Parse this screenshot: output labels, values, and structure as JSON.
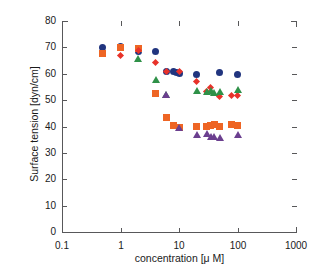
{
  "chart_data": {
    "type": "scatter",
    "title": "",
    "xlabel": "concentration [μ M]",
    "ylabel": "Surface tension [dyn/cm]",
    "xscale": "log",
    "xlim": [
      0.1,
      1000
    ],
    "ylim": [
      0,
      80
    ],
    "xticks": [
      0.1,
      1,
      10,
      100,
      1000
    ],
    "xticklabels": [
      "0.1",
      "1",
      "10",
      "100",
      "1000"
    ],
    "yticks": [
      0,
      10,
      20,
      30,
      40,
      50,
      60,
      70,
      80
    ],
    "yticklabels": [
      "0",
      "10",
      "20",
      "30",
      "40",
      "50",
      "60",
      "70",
      "80"
    ],
    "grid": false,
    "legend": "none",
    "series": [
      {
        "name": "blue-circles",
        "marker": "circle",
        "color": "#21357f",
        "points": [
          {
            "x": 0.5,
            "y": 70.0
          },
          {
            "x": 1.0,
            "y": 70.3
          },
          {
            "x": 2.0,
            "y": 68.5
          },
          {
            "x": 4.0,
            "y": 68.4
          },
          {
            "x": 6.0,
            "y": 60.8
          },
          {
            "x": 8.0,
            "y": 60.8
          },
          {
            "x": 9.0,
            "y": 60.6
          },
          {
            "x": 10.0,
            "y": 60.2
          },
          {
            "x": 20.0,
            "y": 59.9
          },
          {
            "x": 50.0,
            "y": 60.5
          },
          {
            "x": 100.0,
            "y": 59.9
          }
        ]
      },
      {
        "name": "orange-squares",
        "marker": "square",
        "color": "#ee6524",
        "points": [
          {
            "x": 0.5,
            "y": 67.7
          },
          {
            "x": 1.0,
            "y": 69.8
          },
          {
            "x": 2.0,
            "y": 69.6
          },
          {
            "x": 4.0,
            "y": 52.6
          },
          {
            "x": 6.0,
            "y": 43.4
          },
          {
            "x": 8.0,
            "y": 40.3
          },
          {
            "x": 10.0,
            "y": 39.8
          },
          {
            "x": 20.0,
            "y": 40.1
          },
          {
            "x": 30.0,
            "y": 40.1
          },
          {
            "x": 35.0,
            "y": 40.4
          },
          {
            "x": 40.0,
            "y": 40.6
          },
          {
            "x": 50.0,
            "y": 40.0
          },
          {
            "x": 80.0,
            "y": 40.6
          },
          {
            "x": 100.0,
            "y": 40.2
          }
        ]
      },
      {
        "name": "red-diamonds",
        "marker": "diamond",
        "color": "#e8322a",
        "points": [
          {
            "x": 1.0,
            "y": 67.0
          },
          {
            "x": 2.0,
            "y": 69.0
          },
          {
            "x": 4.0,
            "y": 64.3
          },
          {
            "x": 6.0,
            "y": 61.0
          },
          {
            "x": 10.0,
            "y": 60.7
          },
          {
            "x": 20.0,
            "y": 57.2
          },
          {
            "x": 30.0,
            "y": 53.2
          },
          {
            "x": 35.0,
            "y": 54.8
          },
          {
            "x": 50.0,
            "y": 51.5
          },
          {
            "x": 80.0,
            "y": 51.6
          },
          {
            "x": 100.0,
            "y": 51.9
          }
        ]
      },
      {
        "name": "green-triangles",
        "marker": "triangle",
        "color": "#2f9148",
        "points": [
          {
            "x": 2.0,
            "y": 65.5
          },
          {
            "x": 4.0,
            "y": 57.8
          },
          {
            "x": 6.0,
            "y": 52.0
          },
          {
            "x": 20.0,
            "y": 53.3
          },
          {
            "x": 30.0,
            "y": 52.9
          },
          {
            "x": 35.0,
            "y": 53.4
          },
          {
            "x": 40.0,
            "y": 52.8
          },
          {
            "x": 50.0,
            "y": 53.2
          },
          {
            "x": 100.0,
            "y": 53.8
          }
        ]
      },
      {
        "name": "purple-triangles",
        "marker": "triangle",
        "color": "#6b3f8f",
        "points": [
          {
            "x": 6.0,
            "y": 52.0
          },
          {
            "x": 10.0,
            "y": 39.6
          },
          {
            "x": 20.0,
            "y": 36.6
          },
          {
            "x": 30.0,
            "y": 37.0
          },
          {
            "x": 35.0,
            "y": 36.2
          },
          {
            "x": 40.0,
            "y": 35.9
          },
          {
            "x": 50.0,
            "y": 35.7
          },
          {
            "x": 100.0,
            "y": 36.8
          }
        ]
      }
    ]
  }
}
